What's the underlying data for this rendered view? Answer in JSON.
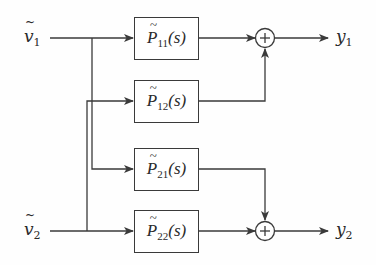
{
  "diagram": {
    "type": "block-diagram",
    "inputs": [
      {
        "id": "v1",
        "symbol": "v",
        "sub": "1",
        "tilde": true
      },
      {
        "id": "v2",
        "symbol": "v",
        "sub": "2",
        "tilde": true
      }
    ],
    "outputs": [
      {
        "id": "y1",
        "symbol": "y",
        "sub": "1"
      },
      {
        "id": "y2",
        "symbol": "y",
        "sub": "2"
      }
    ],
    "blocks": [
      {
        "id": "P11",
        "symbol": "P",
        "sub": "11",
        "arg": "(s)",
        "from": "v1",
        "to": "sum1"
      },
      {
        "id": "P12",
        "symbol": "P",
        "sub": "12",
        "arg": "(s)",
        "from": "v2",
        "to": "sum1"
      },
      {
        "id": "P21",
        "symbol": "P",
        "sub": "21",
        "arg": "(s)",
        "from": "v1",
        "to": "sum2"
      },
      {
        "id": "P22",
        "symbol": "P",
        "sub": "22",
        "arg": "(s)",
        "from": "v2",
        "to": "sum2"
      }
    ],
    "summing_junctions": [
      {
        "id": "sum1",
        "glyph": "+",
        "output": "y1"
      },
      {
        "id": "sum2",
        "glyph": "+",
        "output": "y2"
      }
    ],
    "colors": {
      "line": "#3a3a3a",
      "text": "#2a2a2a",
      "background": "#fefefe"
    }
  }
}
